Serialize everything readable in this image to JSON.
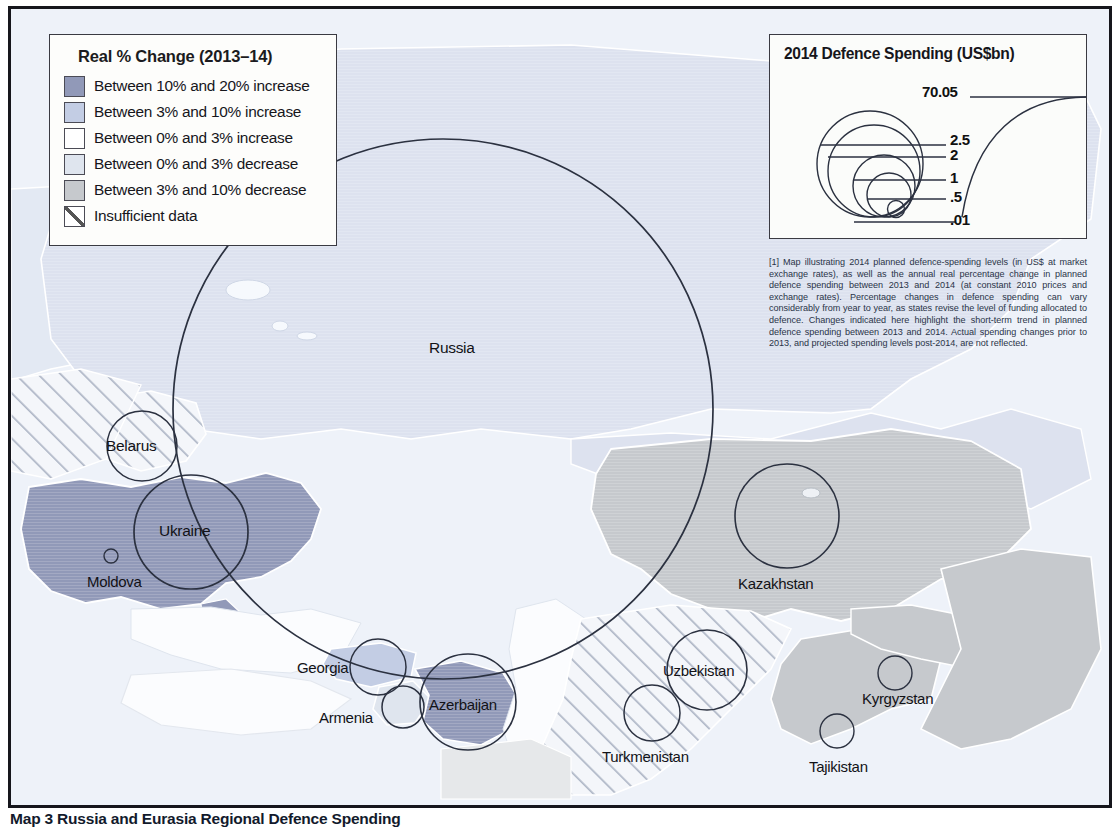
{
  "map": {
    "caption": "Map 3 Russia and Eurasia Regional Defence Spending",
    "legend_change": {
      "title": "Real % Change (2013–14)",
      "items": [
        {
          "label": "Between 10% and 20% increase",
          "color": "#9199b8"
        },
        {
          "label": "Between 3% and 10% increase",
          "color": "#c3cde4"
        },
        {
          "label": "Between 0% and 3% increase",
          "color": "#ffffff"
        },
        {
          "label": "Between 0% and 3% decrease",
          "color": "#dfe5ee"
        },
        {
          "label": "Between 3% and 10% decrease",
          "color": "#c6c9cd"
        },
        {
          "label": "Insufficient data",
          "color": "hatch"
        }
      ]
    },
    "legend_spending": {
      "title": "2014 Defence Spending (US$bn)",
      "ticks": [
        "70.05",
        "2.5",
        "2",
        "1",
        ".5",
        ".01"
      ]
    },
    "footnote": "[1] Map illustrating 2014 planned defence-spending levels (in US$ at market exchange rates), as well as the annual real percentage change in planned defence spending between 2013 and 2014 (at constant 2010 prices and exchange rates). Percentage changes in defence spending can vary considerably from year to year, as states revise the level of funding allocated to defence. Changes indicated here highlight the short-term trend in planned defence spending between 2013 and 2014. Actual spending changes prior to 2013, and projected spending levels post-2014, are not reflected.",
    "countries": [
      {
        "name": "Russia",
        "label_x": 418,
        "label_y": 330,
        "cx": 432,
        "cy": 400,
        "r": 270,
        "fill": "#dde2ef"
      },
      {
        "name": "Belarus",
        "label_x": 95,
        "label_y": 428,
        "cx": 131,
        "cy": 437,
        "r": 35,
        "fill": "hatch"
      },
      {
        "name": "Ukraine",
        "label_x": 148,
        "label_y": 513,
        "cx": 180,
        "cy": 523,
        "r": 57,
        "fill": "#9199b8"
      },
      {
        "name": "Moldova",
        "label_x": 76,
        "label_y": 564,
        "cx": 100,
        "cy": 547,
        "r": 7,
        "fill": "#dfe5ee"
      },
      {
        "name": "Georgia",
        "label_x": 286,
        "label_y": 655,
        "cx": 367,
        "cy": 658,
        "r": 28,
        "fill": "#c3cde4"
      },
      {
        "name": "Armenia",
        "label_x": 308,
        "label_y": 704,
        "cx": 392,
        "cy": 698,
        "r": 21,
        "fill": "#dfe5ee"
      },
      {
        "name": "Azerbaijan",
        "label_x": 418,
        "label_y": 692,
        "cx": 457,
        "cy": 693,
        "r": 48,
        "fill": "#9199b8"
      },
      {
        "name": "Kazakhstan",
        "label_x": 727,
        "label_y": 572,
        "cx": 776,
        "cy": 507,
        "r": 52,
        "fill": "#c6c9cd"
      },
      {
        "name": "Uzbekistan",
        "label_x": 652,
        "label_y": 659,
        "cx": 696,
        "cy": 661,
        "r": 40,
        "fill": "hatch"
      },
      {
        "name": "Turkmenistan",
        "label_x": 591,
        "label_y": 745,
        "cx": 641,
        "cy": 704,
        "r": 28,
        "fill": "hatch"
      },
      {
        "name": "Tajikistan",
        "label_x": 798,
        "label_y": 755,
        "cx": 826,
        "cy": 722,
        "r": 17,
        "fill": "#c6c9cd"
      },
      {
        "name": "Kyrgyzstan",
        "label_x": 851,
        "label_y": 688,
        "cx": 884,
        "cy": 664,
        "r": 17,
        "fill": "#c6c9cd"
      }
    ],
    "colors": {
      "ocean": "#eef2f9",
      "russia": "#dde2ef",
      "ukraine": "#9199b8",
      "kazakh_gray": "#c6c9cd",
      "frame": "#16161c",
      "line": "#2b3140"
    }
  }
}
